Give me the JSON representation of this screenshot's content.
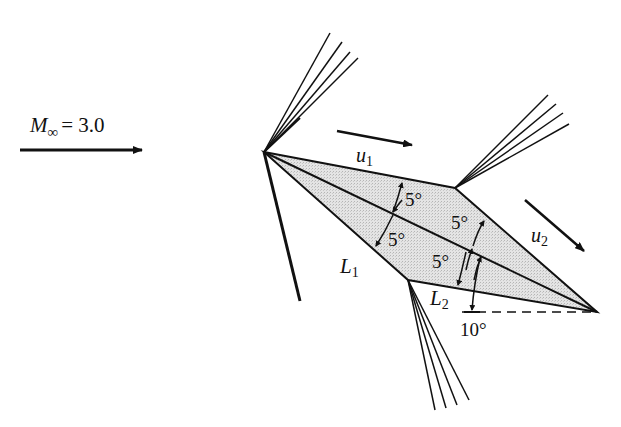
{
  "diagram": {
    "freestream": {
      "label_symbol": "M",
      "label_subscript": "∞",
      "label_value": "= 3.0"
    },
    "velocity_labels": {
      "u1_symbol": "u",
      "u1_subscript": "1",
      "u2_symbol": "u",
      "u2_subscript": "2"
    },
    "length_labels": {
      "L1_symbol": "L",
      "L1_subscript": "1",
      "L2_symbol": "L",
      "L2_subscript": "2"
    },
    "angles": {
      "upper_front": "5°",
      "upper_rear": "5°",
      "lower_front": "5°",
      "lower_rear": "5°",
      "angle_of_attack": "10°"
    },
    "colors": {
      "stroke": "#111111",
      "fill_shading": "#d9d9d9",
      "background": "#ffffff"
    }
  }
}
